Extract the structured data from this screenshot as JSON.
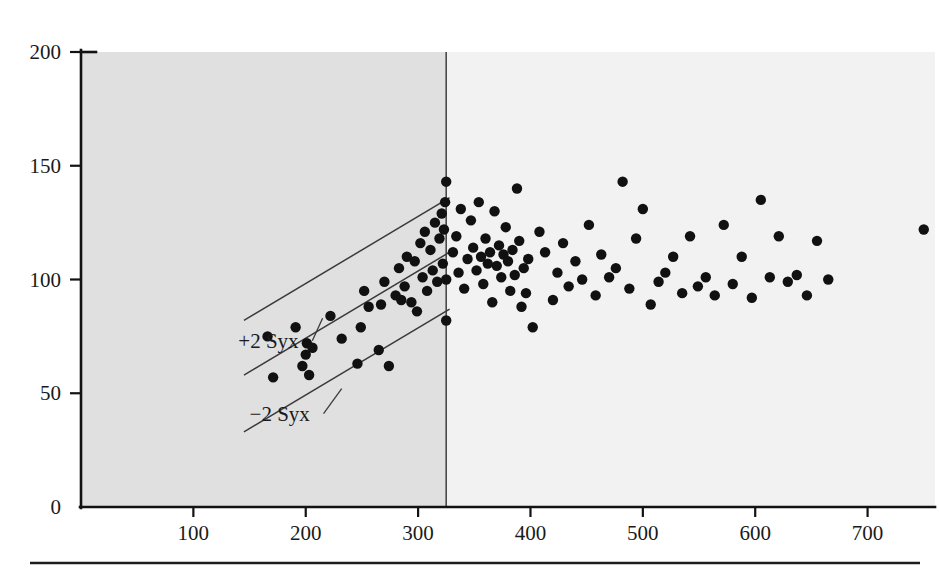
{
  "figure": {
    "background_color": "#ffffff",
    "point_color": "#111111",
    "axis_color": "#121212",
    "shaded_region_color": "#e0e0e0",
    "plot_region_color": "#f2f2f2",
    "band_line_color": "#3a3a3a"
  },
  "chart_data": {
    "type": "scatter",
    "title": "",
    "subtitle": "",
    "xlabel": "",
    "ylabel": "",
    "xlim": [
      0,
      760
    ],
    "ylim": [
      0,
      200
    ],
    "grid": false,
    "legend_position": "none",
    "x_ticks": [
      100,
      200,
      300,
      400,
      500,
      600,
      700
    ],
    "x_tick_labels": [
      "100",
      "200",
      "300",
      "400",
      "500",
      "600",
      "700"
    ],
    "y_ticks": [
      0,
      50,
      100,
      150,
      200
    ],
    "y_tick_labels": [
      "0",
      "50",
      "100",
      "150",
      "200"
    ],
    "annotations": [
      {
        "text": "+2 Syx",
        "x": 140,
        "y": 70,
        "points_to_x": 215,
        "points_to_y": 83
      },
      {
        "text": "−2 Syx",
        "x": 150,
        "y": 38,
        "points_to_x": 232,
        "points_to_y": 52
      }
    ],
    "bands": {
      "description": "Regression line with +2 Syx and -2 Syx prediction bands over the calibration range",
      "x_start": 145,
      "x_end": 328,
      "center_line": {
        "y_start": 58,
        "y_end": 112
      },
      "upper_line": {
        "y_start": 82,
        "y_end": 136
      },
      "lower_line": {
        "y_start": 33,
        "y_end": 87
      }
    },
    "shaded_region": {
      "x_start": 0,
      "x_end": 325,
      "note": "darker shaded calibration region left of the vertical divider"
    },
    "divider_x": 325,
    "series": [
      {
        "name": "Calibration range (shaded)",
        "points": [
          [
            166,
            75
          ],
          [
            171,
            57
          ],
          [
            191,
            79
          ],
          [
            197,
            62
          ],
          [
            200,
            67
          ],
          [
            201,
            72
          ],
          [
            203,
            58
          ],
          [
            206,
            70
          ],
          [
            222,
            84
          ],
          [
            232,
            74
          ],
          [
            246,
            63
          ],
          [
            249,
            79
          ],
          [
            252,
            95
          ],
          [
            256,
            88
          ],
          [
            265,
            69
          ],
          [
            267,
            89
          ],
          [
            270,
            99
          ],
          [
            274,
            62
          ],
          [
            280,
            93
          ],
          [
            283,
            105
          ],
          [
            285,
            91
          ],
          [
            288,
            97
          ],
          [
            290,
            110
          ],
          [
            294,
            90
          ],
          [
            297,
            108
          ],
          [
            299,
            86
          ],
          [
            302,
            116
          ],
          [
            304,
            101
          ],
          [
            306,
            121
          ],
          [
            308,
            95
          ],
          [
            311,
            113
          ],
          [
            313,
            104
          ],
          [
            315,
            125
          ],
          [
            317,
            99
          ],
          [
            319,
            118
          ],
          [
            321,
            129
          ],
          [
            322,
            107
          ],
          [
            323,
            122
          ],
          [
            324,
            134
          ],
          [
            325,
            143
          ],
          [
            325,
            100
          ],
          [
            325,
            82
          ]
        ]
      },
      {
        "name": "Extrapolated range",
        "points": [
          [
            331,
            112
          ],
          [
            334,
            119
          ],
          [
            336,
            103
          ],
          [
            338,
            131
          ],
          [
            341,
            96
          ],
          [
            344,
            109
          ],
          [
            347,
            126
          ],
          [
            349,
            114
          ],
          [
            352,
            104
          ],
          [
            354,
            134
          ],
          [
            356,
            110
          ],
          [
            358,
            98
          ],
          [
            360,
            118
          ],
          [
            362,
            107
          ],
          [
            364,
            112
          ],
          [
            366,
            90
          ],
          [
            368,
            130
          ],
          [
            370,
            106
          ],
          [
            372,
            115
          ],
          [
            374,
            101
          ],
          [
            376,
            111
          ],
          [
            378,
            123
          ],
          [
            380,
            108
          ],
          [
            382,
            95
          ],
          [
            384,
            113
          ],
          [
            386,
            102
          ],
          [
            388,
            140
          ],
          [
            390,
            117
          ],
          [
            392,
            88
          ],
          [
            394,
            105
          ],
          [
            396,
            94
          ],
          [
            398,
            109
          ],
          [
            402,
            79
          ],
          [
            408,
            121
          ],
          [
            413,
            112
          ],
          [
            420,
            91
          ],
          [
            424,
            103
          ],
          [
            429,
            116
          ],
          [
            434,
            97
          ],
          [
            440,
            108
          ],
          [
            446,
            100
          ],
          [
            452,
            124
          ],
          [
            458,
            93
          ],
          [
            463,
            111
          ],
          [
            470,
            101
          ],
          [
            476,
            105
          ],
          [
            482,
            143
          ],
          [
            488,
            96
          ],
          [
            494,
            118
          ],
          [
            500,
            131
          ],
          [
            507,
            89
          ],
          [
            514,
            99
          ],
          [
            520,
            103
          ],
          [
            527,
            110
          ],
          [
            535,
            94
          ],
          [
            542,
            119
          ],
          [
            549,
            97
          ],
          [
            556,
            101
          ],
          [
            564,
            93
          ],
          [
            572,
            124
          ],
          [
            580,
            98
          ],
          [
            588,
            110
          ],
          [
            597,
            92
          ],
          [
            605,
            135
          ],
          [
            613,
            101
          ],
          [
            621,
            119
          ],
          [
            629,
            99
          ],
          [
            637,
            102
          ],
          [
            646,
            93
          ],
          [
            655,
            117
          ],
          [
            665,
            100
          ],
          [
            750,
            122
          ]
        ]
      }
    ]
  }
}
